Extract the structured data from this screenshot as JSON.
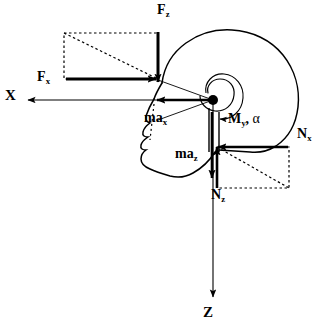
{
  "diagram": {
    "colors": {
      "stroke": "#000000",
      "background": "#ffffff",
      "dashed": "#000000"
    },
    "labels": {
      "force_z_top": {
        "base": "F",
        "sub": "z",
        "x": 157,
        "y": 4
      },
      "force_x_left": {
        "base": "F",
        "sub": "x",
        "x": 37,
        "y": 72
      },
      "axis_x": {
        "base": "X",
        "sub": "",
        "x": 6,
        "y": 89
      },
      "axis_z": {
        "base": "Z",
        "sub": "",
        "x": 203,
        "y": 306
      },
      "ma_x": {
        "base": "ma",
        "sub": "x",
        "x": 144,
        "y": 112
      },
      "ma_z": {
        "base": "ma",
        "sub": "z",
        "x": 175,
        "y": 148
      },
      "moment_my_alpha": {
        "base": "M",
        "sub": "y",
        "comma": ",",
        "alpha": "α",
        "x": 228,
        "y": 113
      },
      "normal_x": {
        "base": "N",
        "sub": "x",
        "x": 297,
        "y": 128
      },
      "normal_z": {
        "base": "N",
        "sub": "z",
        "x": 211,
        "y": 189
      }
    },
    "vectors": [
      {
        "name": "applied-force-z",
        "label": "F_z",
        "direction": "down",
        "from": [
          158,
          32
        ],
        "to": [
          158,
          84
        ],
        "weight": "heavy"
      },
      {
        "name": "applied-force-x",
        "label": "F_x",
        "direction": "right",
        "from": [
          68,
          79
        ],
        "to": [
          158,
          79
        ],
        "weight": "heavy"
      },
      {
        "name": "axis-x",
        "label": "X",
        "direction": "left",
        "from": [
          213,
          100
        ],
        "to": [
          26,
          100
        ],
        "weight": "light"
      },
      {
        "name": "axis-z",
        "label": "Z",
        "direction": "down",
        "from": [
          213,
          100
        ],
        "to": [
          213,
          299
        ],
        "weight": "light"
      },
      {
        "name": "inertia-ma-x",
        "label": "ma_x",
        "direction": "left",
        "from": [
          213,
          100
        ],
        "to": [
          155,
          100
        ],
        "weight": "heavy"
      },
      {
        "name": "inertia-ma-z",
        "label": "ma_z",
        "direction": "down",
        "from": [
          213,
          112
        ],
        "to": [
          213,
          180
        ],
        "weight": "heavy"
      },
      {
        "name": "reaction-normal-x",
        "label": "N_x",
        "direction": "left",
        "from": [
          286,
          147
        ],
        "to": [
          216,
          147
        ],
        "weight": "heavy"
      },
      {
        "name": "reaction-normal-z",
        "label": "N_z",
        "direction": "up",
        "from": [
          217,
          188
        ],
        "to": [
          217,
          145
        ],
        "weight": "heavy"
      },
      {
        "name": "moment-my",
        "label": "M_y, α",
        "direction": "clockwise-arc",
        "weight": "light"
      }
    ],
    "dashed_boxes": [
      {
        "name": "upper-left-resultant-box",
        "x": 64,
        "y": 33,
        "width": 94,
        "height": 46,
        "diagonal": "tl-br"
      },
      {
        "name": "lower-right-resultant-box",
        "x": 217,
        "y": 147,
        "width": 72,
        "height": 41,
        "diagonal": "tl-br"
      }
    ],
    "pivot": {
      "name": "occipital-condyle-pivot",
      "x": 213,
      "y": 100,
      "radius": 5
    }
  }
}
